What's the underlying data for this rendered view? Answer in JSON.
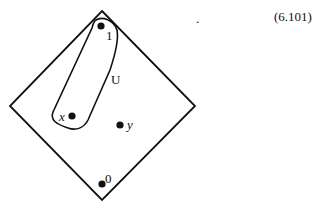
{
  "equation_number": "(6.101)",
  "period": ".",
  "labels": {
    "top": "1",
    "bottom": "0",
    "x": "x",
    "y": "y",
    "set": "U"
  }
}
